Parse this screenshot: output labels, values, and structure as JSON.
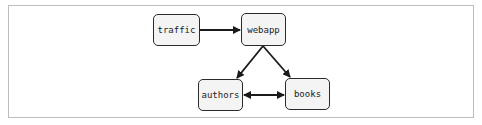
{
  "diagram": {
    "nodes": [
      {
        "id": "traffic",
        "label": "traffic"
      },
      {
        "id": "webapp",
        "label": "webapp"
      },
      {
        "id": "authors",
        "label": "authors"
      },
      {
        "id": "books",
        "label": "books"
      }
    ],
    "edges": [
      {
        "from": "traffic",
        "to": "webapp",
        "direction": "forward"
      },
      {
        "from": "webapp",
        "to": "authors",
        "direction": "forward"
      },
      {
        "from": "webapp",
        "to": "books",
        "direction": "forward"
      },
      {
        "from": "authors",
        "to": "books",
        "direction": "both"
      }
    ],
    "colors": {
      "stroke": "#2b2b2b",
      "node_fill": "#f4f4f4",
      "frame": "#bdbdbd"
    }
  }
}
